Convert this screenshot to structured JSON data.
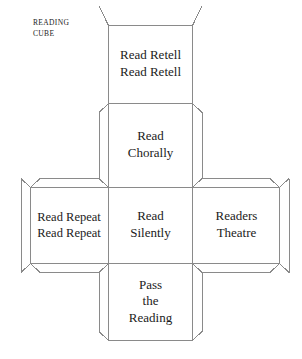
{
  "figure": {
    "name": "Reading Cube",
    "corner_label": {
      "line1": "READING",
      "line2": "CUBE"
    },
    "top_clipped_text": "",
    "bottom_clipped_caption": "",
    "line_color": "#8a8a8a",
    "text_color": "#1b1b1b",
    "background": "#ffffff"
  },
  "net": {
    "type": "cube-net",
    "description": "Unfolded cube template in a cross arrangement with glue flaps",
    "faces": [
      {
        "id": "top-face",
        "position": "column-top",
        "lines": [
          "Read Retell",
          "Read Retell"
        ]
      },
      {
        "id": "upper-mid-face",
        "position": "column-upper-middle",
        "lines": [
          "Read",
          "Chorally"
        ]
      },
      {
        "id": "left-face",
        "position": "row-left",
        "lines": [
          "Read Repeat",
          "Read Repeat"
        ]
      },
      {
        "id": "center-face",
        "position": "row-center",
        "lines": [
          "Read",
          "Silently"
        ]
      },
      {
        "id": "right-face",
        "position": "row-right",
        "lines": [
          "Readers",
          "Theatre"
        ]
      },
      {
        "id": "bottom-face",
        "position": "column-bottom",
        "lines": [
          "Pass",
          "the",
          "Reading"
        ]
      }
    ]
  },
  "labels": {
    "top_face_line1": "Read Retell",
    "top_face_line2": "Read Retell",
    "upper_mid_line1": "Read",
    "upper_mid_line2": "Chorally",
    "left_face_line1": "Read Repeat",
    "left_face_line2": "Read Repeat",
    "center_face_line1": "Read",
    "center_face_line2": "Silently",
    "right_face_line1": "Readers",
    "right_face_line2": "Theatre",
    "bottom_face_line1": "Pass",
    "bottom_face_line2": "the",
    "bottom_face_line3": "Reading"
  }
}
